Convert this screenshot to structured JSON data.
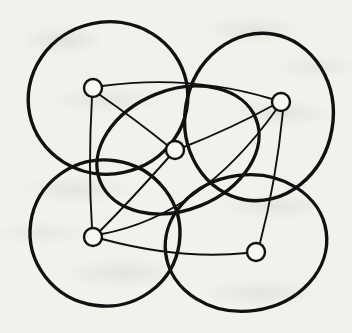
{
  "figure": {
    "kind": "circle-intersection-graph-diagram",
    "background_color": "#f3f1ec",
    "ink_color": "#111111",
    "node_fill_color": "#f7f6f3",
    "canvas": {
      "width": 352,
      "height": 333
    }
  },
  "diagram_data": {
    "type": "node-link-diagram",
    "node_radius": 9,
    "node_stroke_width": 2.4,
    "edge_stroke_width": 1.9,
    "region_stroke_width": 3.4,
    "nodes": [
      {
        "id": "n-top-left",
        "label": "top-left vertex",
        "x": 93,
        "y": 88
      },
      {
        "id": "n-top-right",
        "label": "top-right vertex",
        "x": 281,
        "y": 102
      },
      {
        "id": "n-center",
        "label": "center vertex",
        "x": 175,
        "y": 150
      },
      {
        "id": "n-bottom-left",
        "label": "bottom-left vertex",
        "x": 93,
        "y": 237
      },
      {
        "id": "n-bottom-right",
        "label": "bottom-right vertex",
        "x": 256,
        "y": 252
      }
    ],
    "edges": [
      {
        "id": "e-tl-tr",
        "from": "n-top-left",
        "to": "n-top-right",
        "path": "M 102 86 Q 190 74 272 99"
      },
      {
        "id": "e-tl-c",
        "from": "n-top-left",
        "to": "n-center",
        "path": "M 100 95 Q 136 120 167 145"
      },
      {
        "id": "e-tl-bl",
        "from": "n-top-left",
        "to": "n-bottom-left",
        "path": "M 92 97 Q 88 168 92 228"
      },
      {
        "id": "e-c-tr",
        "from": "n-center",
        "to": "n-top-right",
        "path": "M 184 147 Q 232 128 272 106"
      },
      {
        "id": "e-c-bl",
        "from": "n-center",
        "to": "n-bottom-left",
        "path": "M 169 157 Q 131 200 100 231"
      },
      {
        "id": "e-bl-br",
        "from": "n-bottom-left",
        "to": "n-bottom-right",
        "path": "M 102 239 Q 180 260 247 253"
      },
      {
        "id": "e-bl-tr",
        "from": "n-bottom-left",
        "to": "n-top-right",
        "path": "M 102 234 Q 200 216 276 110"
      },
      {
        "id": "e-tr-br",
        "from": "n-top-right",
        "to": "n-bottom-right",
        "path": "M 283 111 Q 276 182 260 243"
      }
    ],
    "regions": [
      {
        "id": "r-top-left",
        "label": "top-left disk",
        "cx": 108,
        "cy": 98,
        "rx": 80,
        "ry": 76,
        "rotate": -12
      },
      {
        "id": "r-top-right",
        "label": "top-right disk",
        "cx": 259,
        "cy": 117,
        "rx": 74,
        "ry": 84,
        "rotate": 10
      },
      {
        "id": "r-bottom-left",
        "label": "bottom-left disk",
        "cx": 105,
        "cy": 233,
        "rx": 75,
        "ry": 73,
        "rotate": 8
      },
      {
        "id": "r-bottom-right",
        "label": "bottom-right disk",
        "cx": 246,
        "cy": 243,
        "rx": 81,
        "ry": 68,
        "rotate": -8
      },
      {
        "id": "r-center",
        "label": "center ellipse",
        "cx": 178,
        "cy": 150,
        "rx": 84,
        "ry": 60,
        "rotate": -22
      }
    ]
  }
}
